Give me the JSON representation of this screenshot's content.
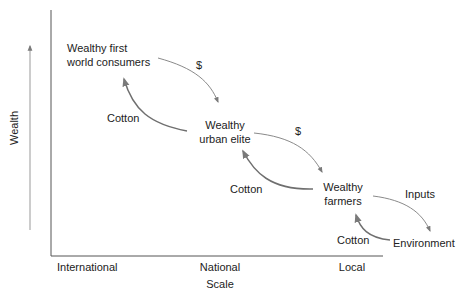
{
  "diagram": {
    "y_axis": {
      "label": "Wealth"
    },
    "x_axis": {
      "label": "Scale",
      "ticks": [
        "International",
        "National",
        "Local"
      ]
    },
    "nodes": [
      {
        "id": "consumers",
        "line1": "Wealthy first",
        "line2": "world consumers"
      },
      {
        "id": "urban_elite",
        "line1": "Wealthy",
        "line2": "urban elite"
      },
      {
        "id": "farmers",
        "line1": "Wealthy",
        "line2": "farmers"
      },
      {
        "id": "environment",
        "line1": "Environment"
      }
    ],
    "flows": [
      {
        "from": "consumers",
        "to": "urban_elite",
        "label": "$"
      },
      {
        "from": "urban_elite",
        "to": "consumers",
        "label": "Cotton"
      },
      {
        "from": "urban_elite",
        "to": "farmers",
        "label": "$"
      },
      {
        "from": "farmers",
        "to": "urban_elite",
        "label": "Cotton"
      },
      {
        "from": "farmers",
        "to": "environment",
        "label": "Inputs"
      },
      {
        "from": "environment",
        "to": "farmers",
        "label": "Cotton"
      }
    ],
    "colors": {
      "text": "#222222",
      "arrow": "#7a7a7a",
      "axis": "#555555"
    }
  }
}
